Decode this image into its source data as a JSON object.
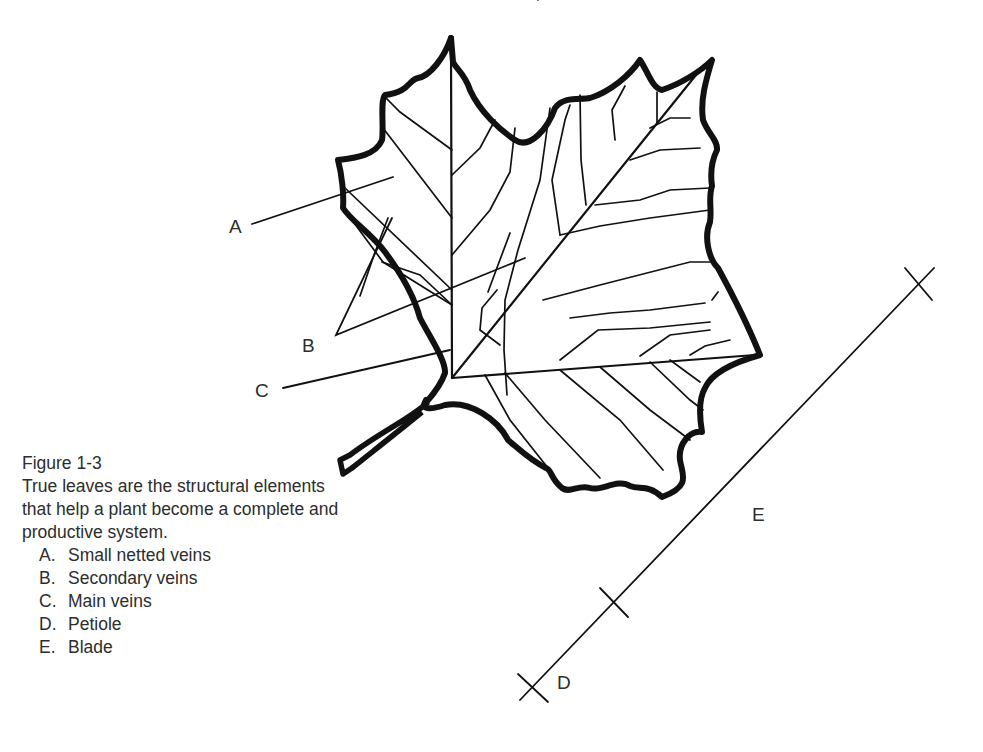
{
  "figure": {
    "title": "Figure 1-3",
    "description": "True leaves are the structural elements that help a plant become a complete and productive system.",
    "legend": [
      {
        "letter": "A.",
        "text": "Small netted veins"
      },
      {
        "letter": "B.",
        "text": "Secondary veins"
      },
      {
        "letter": "C.",
        "text": "Main veins"
      },
      {
        "letter": "D.",
        "text": "Petiole"
      },
      {
        "letter": "E.",
        "text": "Blade"
      }
    ]
  },
  "diagram": {
    "labels": {
      "a": "A",
      "b": "B",
      "c": "C",
      "d": "D",
      "e": "E"
    },
    "colors": {
      "outline": "#111111",
      "background": "#ffffff",
      "text": "#2d2d2d"
    }
  }
}
